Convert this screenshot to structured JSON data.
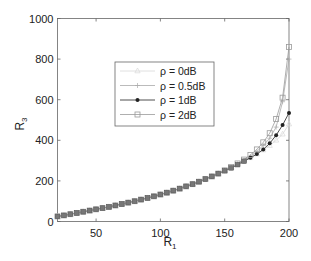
{
  "chart_data": {
    "type": "line",
    "title": "",
    "xlabel": "R_1",
    "ylabel": "R_3",
    "xlim": [
      20,
      200
    ],
    "ylim": [
      0,
      1000
    ],
    "xticks": [
      50,
      100,
      150,
      200
    ],
    "yticks": [
      0,
      200,
      400,
      600,
      800,
      1000
    ],
    "grid": false,
    "legend_position": "inside upper-center",
    "x": [
      20,
      25,
      30,
      35,
      40,
      45,
      50,
      55,
      60,
      65,
      70,
      75,
      80,
      85,
      90,
      95,
      100,
      105,
      110,
      115,
      120,
      125,
      130,
      135,
      140,
      145,
      150,
      155,
      160,
      165,
      170,
      175,
      180,
      185,
      190,
      195,
      200
    ],
    "series": [
      {
        "name": "ρ = 0dB",
        "marker": "triangle",
        "color": "#d8d8d8",
        "values": [
          25,
          30,
          36,
          42,
          48,
          54,
          60,
          66,
          72,
          79,
          86,
          93,
          100,
          108,
          116,
          124,
          133,
          142,
          152,
          162,
          173,
          184,
          196,
          209,
          222,
          236,
          250,
          264,
          280,
          297,
          314,
          332,
          352,
          374,
          400,
          430,
          480
        ]
      },
      {
        "name": "ρ = 0.5dB",
        "marker": "plus",
        "color": "#aaaaaa",
        "values": [
          25,
          30,
          36,
          42,
          48,
          54,
          60,
          66,
          72,
          79,
          86,
          93,
          100,
          108,
          116,
          124,
          133,
          142,
          152,
          162,
          173,
          184,
          196,
          209,
          222,
          236,
          250,
          265,
          282,
          300,
          320,
          345,
          375,
          410,
          465,
          590,
          800
        ]
      },
      {
        "name": "ρ = 1dB",
        "marker": "star",
        "color": "#222222",
        "values": [
          25,
          30,
          36,
          42,
          48,
          54,
          60,
          66,
          72,
          79,
          86,
          93,
          100,
          108,
          116,
          124,
          133,
          142,
          152,
          162,
          173,
          184,
          196,
          209,
          222,
          236,
          250,
          264,
          280,
          297,
          314,
          332,
          355,
          385,
          425,
          475,
          535
        ]
      },
      {
        "name": "ρ = 2dB",
        "marker": "square",
        "color": "#9a9a9a",
        "values": [
          25,
          30,
          36,
          42,
          48,
          54,
          60,
          66,
          72,
          79,
          86,
          93,
          100,
          108,
          116,
          124,
          133,
          142,
          152,
          162,
          173,
          184,
          196,
          209,
          222,
          236,
          252,
          268,
          286,
          305,
          328,
          355,
          390,
          435,
          505,
          610,
          860
        ]
      }
    ]
  }
}
